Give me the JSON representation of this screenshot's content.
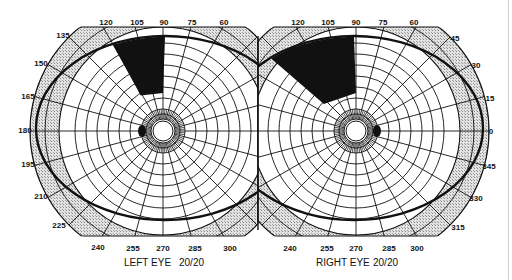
{
  "figure": {
    "type": "visual-field-perimetry-chart",
    "colors": {
      "background": "#ffffff",
      "grid_line": "#111111",
      "shaded_band": "#d2d2d2",
      "scotoma": "#111111",
      "field_boundary": "#111111"
    },
    "eyes": [
      {
        "id": "left",
        "label": "LEFT EYE",
        "acuity": "20/20",
        "center": [
          163,
          131
        ],
        "field_boundary": {
          "cx": 165,
          "cy": 128,
          "rx": 129,
          "ry": 92
        },
        "blind_spot": {
          "cx": 142,
          "cy": 131,
          "rx": 4,
          "ry": 6
        },
        "scotoma": {
          "meridian_from": 90,
          "meridian_to": 122,
          "description": "superior nasal wedge defect"
        },
        "degree_labels": [
          "120",
          "105",
          "90",
          "75",
          "60",
          "135",
          "150",
          "165",
          "180",
          "195",
          "210",
          "225",
          "240",
          "255",
          "270",
          "285",
          "300"
        ]
      },
      {
        "id": "right",
        "label": "RIGHT EYE",
        "acuity": "20/20",
        "center": [
          356,
          131
        ],
        "field_boundary": {
          "cx": 354,
          "cy": 128,
          "rx": 129,
          "ry": 92
        },
        "blind_spot": {
          "cx": 377,
          "cy": 131,
          "rx": 4,
          "ry": 6
        },
        "scotoma": {
          "meridian_from": 90,
          "meridian_to": 140,
          "description": "superior temporal wedge defect"
        },
        "degree_labels": [
          "120",
          "105",
          "90",
          "75",
          "60",
          "45",
          "30",
          "15",
          "0",
          "345",
          "330",
          "315",
          "240",
          "255",
          "270",
          "285",
          "300"
        ]
      }
    ],
    "captions": {
      "left": {
        "eye": "LEFT EYE",
        "acuity": "20/20"
      },
      "right": {
        "eye": "RIGHT EYE",
        "acuity": "20/20"
      }
    },
    "ticks": {
      "left": [
        {
          "t": "120",
          "x": 106,
          "y": 25
        },
        {
          "t": "105",
          "x": 137,
          "y": 25
        },
        {
          "t": "90",
          "x": 164,
          "y": 25
        },
        {
          "t": "75",
          "x": 192,
          "y": 25
        },
        {
          "t": "60",
          "x": 224,
          "y": 25
        },
        {
          "t": "135",
          "x": 63,
          "y": 38
        },
        {
          "t": "150",
          "x": 41,
          "y": 66
        },
        {
          "t": "165",
          "x": 28,
          "y": 99
        },
        {
          "t": "180",
          "x": 25,
          "y": 133
        },
        {
          "t": "195",
          "x": 28,
          "y": 167
        },
        {
          "t": "210",
          "x": 41,
          "y": 199
        },
        {
          "t": "225",
          "x": 59,
          "y": 228
        },
        {
          "t": "240",
          "x": 98,
          "y": 250
        },
        {
          "t": "255",
          "x": 133,
          "y": 251
        },
        {
          "t": "270",
          "x": 163,
          "y": 251
        },
        {
          "t": "285",
          "x": 195,
          "y": 251
        },
        {
          "t": "300",
          "x": 230,
          "y": 251
        }
      ],
      "right": [
        {
          "t": "120",
          "x": 298,
          "y": 25
        },
        {
          "t": "105",
          "x": 328,
          "y": 25
        },
        {
          "t": "90",
          "x": 356,
          "y": 25
        },
        {
          "t": "75",
          "x": 383,
          "y": 25
        },
        {
          "t": "60",
          "x": 414,
          "y": 25
        },
        {
          "t": "45",
          "x": 455,
          "y": 41
        },
        {
          "t": "30",
          "x": 476,
          "y": 68
        },
        {
          "t": "15",
          "x": 490,
          "y": 101
        },
        {
          "t": "0",
          "x": 491,
          "y": 134
        },
        {
          "t": "345",
          "x": 489,
          "y": 169
        },
        {
          "t": "330",
          "x": 476,
          "y": 201
        },
        {
          "t": "315",
          "x": 458,
          "y": 230
        },
        {
          "t": "240",
          "x": 290,
          "y": 251
        },
        {
          "t": "255",
          "x": 327,
          "y": 251
        },
        {
          "t": "270",
          "x": 356,
          "y": 251
        },
        {
          "t": "285",
          "x": 389,
          "y": 251
        },
        {
          "t": "300",
          "x": 417,
          "y": 251
        }
      ]
    }
  }
}
